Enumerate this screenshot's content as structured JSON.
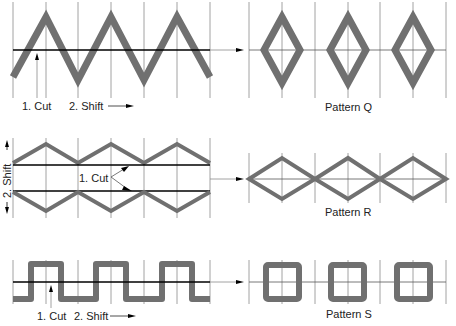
{
  "colors": {
    "stroke_pattern": "#707070",
    "grid": "#8c8c8c",
    "cut_line": "#000000",
    "text": "#222222"
  },
  "rows": [
    {
      "id": "Q",
      "source_shape": "triangle-wave",
      "cut_label": "1. Cut",
      "shift_label": "2. Shift",
      "result_label": "Pattern Q",
      "result_shape": "separated diamonds"
    },
    {
      "id": "R",
      "source_shape": "triangle-wave pair (upper and mirrored lower)",
      "shift_label": "2. Shift",
      "cut_label": "1. Cut",
      "result_label": "Pattern R",
      "result_shape": "connected diamonds"
    },
    {
      "id": "S",
      "source_shape": "square-wave",
      "cut_label": "1. Cut",
      "shift_label": "2. Shift",
      "result_label": "Pattern S",
      "result_shape": "separated squares"
    }
  ]
}
